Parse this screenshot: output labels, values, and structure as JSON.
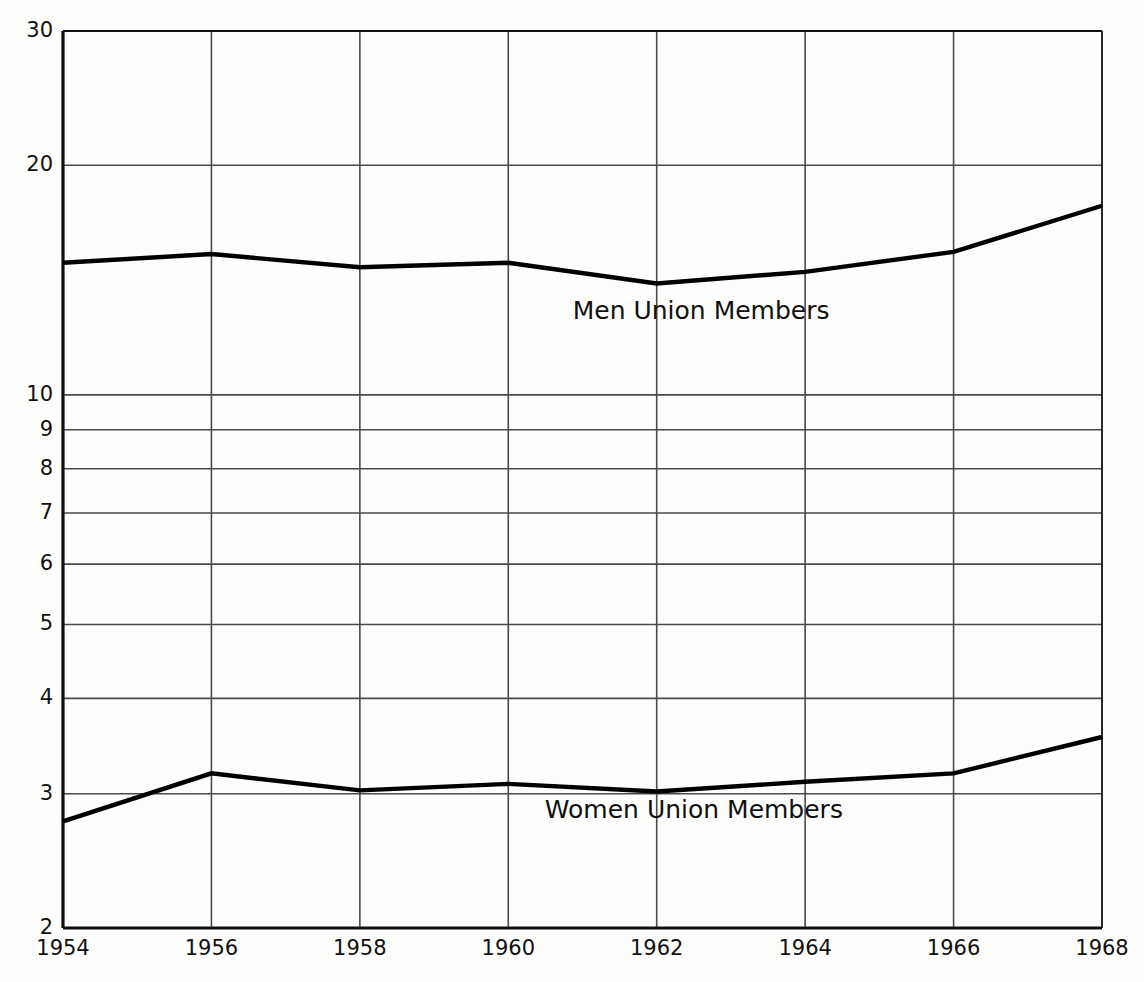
{
  "chart_data": {
    "type": "line",
    "title": "",
    "subtitle": "",
    "xlabel": "",
    "ylabel": "",
    "yscale": "log",
    "ylim": [
      2,
      30
    ],
    "xlim": [
      1954,
      1968
    ],
    "grid": true,
    "legend_position": "inline-annotation",
    "x": [
      1954,
      1956,
      1958,
      1960,
      1962,
      1964,
      1966,
      1968
    ],
    "xticks": [
      "1954",
      "1956",
      "1958",
      "1960",
      "1962",
      "1964",
      "1966",
      "1968"
    ],
    "yticks": [
      "30",
      "20",
      "10",
      "9",
      "8",
      "7",
      "6",
      "5",
      "4",
      "3",
      "2"
    ],
    "ytick_values": [
      30,
      20,
      10,
      9,
      8,
      7,
      6,
      5,
      4,
      3,
      2
    ],
    "series": [
      {
        "name": "Men Union Members",
        "values": [
          14.9,
          15.3,
          14.7,
          14.9,
          14.0,
          14.5,
          15.4,
          17.7
        ],
        "color": "#000000"
      },
      {
        "name": "Women Union Members",
        "values": [
          2.76,
          3.19,
          3.03,
          3.09,
          3.02,
          3.11,
          3.19,
          3.56
        ],
        "color": "#000000"
      }
    ],
    "annotations": [
      {
        "text": "Men Union Members",
        "x": 1962.6,
        "y": 12.9
      },
      {
        "text": "Women Union Members",
        "x": 1962.5,
        "y": 2.86
      }
    ]
  },
  "axes": {
    "axis_color": "#111111",
    "grid_color": "#4a4a4a",
    "line_color": "#000000",
    "background": "#fdfdfb"
  }
}
